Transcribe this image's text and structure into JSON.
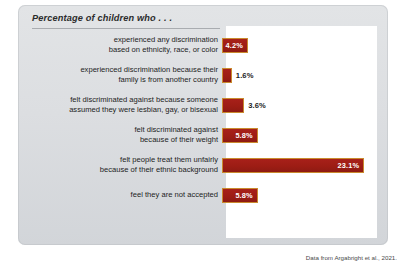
{
  "chart_data": {
    "type": "bar",
    "orientation": "horizontal",
    "title": "Percentage of children who . . .",
    "xlabel": "",
    "ylabel": "",
    "xlim": [
      0,
      24.5
    ],
    "grid": false,
    "legend": null,
    "bar_color": "#a8201a",
    "bar_border_color": "#c98a2e",
    "units": "%",
    "categories": [
      "experienced any discrimination based on ethnicity, race, or color",
      "experienced discrimination because their family is from another country",
      "felt discriminated against because someone assumed they were lesbian, gay, or bisexual",
      "felt discriminated against because of their weight",
      "felt people treat them unfairly because of their ethnic background",
      "feel they are not accepted"
    ],
    "values": [
      4.2,
      1.6,
      3.6,
      5.8,
      23.1,
      5.8
    ],
    "value_labels": [
      "4.2%",
      "1.6%",
      "3.6%",
      "5.8%",
      "23.1%",
      "5.8%"
    ],
    "source": "Data from Argabright et al., 2021."
  },
  "rows": [
    {
      "line1": "experienced any discrimination",
      "line2": "based on ethnicity, race, or color",
      "value": 4.2,
      "label": "4.2%",
      "label_inside": true
    },
    {
      "line1": "experienced discrimination because their",
      "line2": "family is from another country",
      "value": 1.6,
      "label": "1.6%",
      "label_inside": false
    },
    {
      "line1": "felt discriminated against because someone",
      "line2": "assumed they were lesbian, gay, or bisexual",
      "value": 3.6,
      "label": "3.6%",
      "label_inside": false
    },
    {
      "line1": "felt discriminated against",
      "line2": "because of their weight",
      "value": 5.8,
      "label": "5.8%",
      "label_inside": true
    },
    {
      "line1": "felt people treat them unfairly",
      "line2": "because of their ethnic background",
      "value": 23.1,
      "label": "23.1%",
      "label_inside": true
    },
    {
      "line1": "feel they are not accepted",
      "line2": "",
      "value": 5.8,
      "label": "5.8%",
      "label_inside": true
    }
  ],
  "title": "Percentage of children who . . .",
  "source": "Data from Argabright et al., 2021."
}
